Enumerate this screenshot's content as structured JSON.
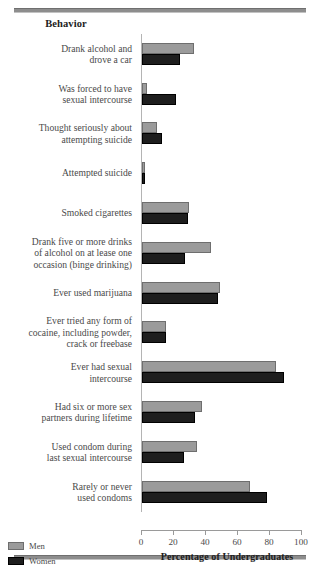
{
  "chart_data": {
    "type": "bar",
    "orientation": "horizontal",
    "title": "",
    "column_header": "Behavior",
    "xlabel": "Percentage of Undergraduates",
    "ylabel": "",
    "xlim": [
      0,
      100
    ],
    "xticks": [
      0,
      20,
      40,
      60,
      80,
      100
    ],
    "xtick_labels": [
      "0",
      "20",
      "40",
      "60",
      "80",
      "100"
    ],
    "grid": false,
    "legend_position": "bottom-left",
    "categories": [
      "Drank alcohol and drove a car",
      "Was forced to have sexual intercourse",
      "Thought seriously about attempting suicide",
      "Attempted suicide",
      "Smoked cigarettes",
      "Drank five or more drinks of alcohol on at lease one occasion (binge drinking)",
      "Ever used marijuana",
      "Ever tried any form of cocaine, including powder, crack or freebase",
      "Ever had sexual intercourse",
      "Had six or more sex partners during lifetime",
      "Used condom during last sexual intercourse",
      "Rarely or never used condoms"
    ],
    "series": [
      {
        "name": "Men",
        "color": "#9b9b9b",
        "values": [
          32.5,
          3.0,
          9.4,
          2.0,
          29.5,
          43.0,
          49.0,
          15.0,
          84.0,
          37.5,
          34.5,
          67.5
        ]
      },
      {
        "name": "Women",
        "color": "#1e1e1e",
        "values": [
          23.5,
          21.0,
          12.5,
          2.0,
          29.0,
          27.0,
          47.5,
          15.0,
          88.5,
          33.0,
          26.5,
          78.0
        ]
      }
    ]
  },
  "chart": {
    "column_header": "Behavior",
    "axis_title": "Percentage of Undergraduates",
    "rows": [
      {
        "label_lines": [
          "Drank alcohol and",
          "drove a car"
        ],
        "men": 32.5,
        "women": 23.5
      },
      {
        "label_lines": [
          "Was forced to have",
          "sexual intercourse"
        ],
        "men": 3.0,
        "women": 21.0
      },
      {
        "label_lines": [
          "Thought seriously about",
          "attempting suicide"
        ],
        "men": 9.4,
        "women": 12.5
      },
      {
        "label_lines": [
          "Attempted suicide"
        ],
        "men": 2.0,
        "women": 2.0
      },
      {
        "label_lines": [
          "Smoked cigarettes"
        ],
        "men": 29.5,
        "women": 29.0
      },
      {
        "label_lines": [
          "Drank five or more drinks",
          "of alcohol on at lease one",
          "occasion (binge drinking)"
        ],
        "men": 43.0,
        "women": 27.0
      },
      {
        "label_lines": [
          "Ever used marijuana"
        ],
        "men": 49.0,
        "women": 47.5
      },
      {
        "label_lines": [
          "Ever tried any form of",
          "cocaine, including powder,",
          "crack or freebase"
        ],
        "men": 15.0,
        "women": 15.0
      },
      {
        "label_lines": [
          "Ever had sexual",
          "intercourse"
        ],
        "men": 84.0,
        "women": 88.5
      },
      {
        "label_lines": [
          "Had six or more sex",
          "partners during lifetime"
        ],
        "men": 37.5,
        "women": 33.0
      },
      {
        "label_lines": [
          "Used condom during",
          "last sexual intercourse"
        ],
        "men": 34.5,
        "women": 26.5
      },
      {
        "label_lines": [
          "Rarely or never",
          "used condoms"
        ],
        "men": 67.5,
        "women": 78.0
      }
    ],
    "xticks": [
      "0",
      "20",
      "40",
      "60",
      "80",
      "100"
    ],
    "legend": [
      {
        "label": "Men",
        "color": "#9b9b9b"
      },
      {
        "label": "Women",
        "color": "#1e1e1e"
      }
    ]
  }
}
